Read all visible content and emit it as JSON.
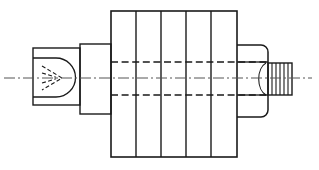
{
  "document": {
    "title": "Mechanical Part Orthographic Section View",
    "background_color": "#ffffff",
    "line_color": "#1a1a1a",
    "centerline_color": "#555555",
    "hidden_line_color": "#1a1a1a",
    "canvas": {
      "width": 319,
      "height": 170
    }
  },
  "drawing": {
    "type": "engineering-orthographic-section",
    "description": "Cylindrical finned machine component shown in side elevation with hidden-detail dashed lines and an axial dash-dot centerline",
    "axis": {
      "name": "centerline",
      "style": "dash-dot",
      "y": 78,
      "x_start": 4,
      "x_end": 312,
      "color": "#555555",
      "width": 1
    },
    "features": [
      {
        "name": "left-end-block",
        "shape": "rectangle",
        "x": 33,
        "y": 48,
        "width": 47,
        "height": 57,
        "label": "Left End Block"
      },
      {
        "name": "internal-cavity",
        "shape": "u-slot-rounded-right",
        "x": 39,
        "y": 58,
        "width": 36,
        "height": 39,
        "corner_radius": 19,
        "label": "Internal Bore Cavity"
      },
      {
        "name": "conical-point-detail",
        "shape": "chevron-dashed",
        "apex_x": 62,
        "apex_y": 78,
        "back_x": 42,
        "top_y": 66,
        "bottom_y": 90,
        "style": "dashed",
        "label": "Conical Point Hidden Detail"
      },
      {
        "name": "left-collar",
        "shape": "rectangle",
        "x": 80,
        "y": 44,
        "width": 31,
        "height": 70,
        "label": "Left Shoulder Collar"
      },
      {
        "name": "finned-body",
        "shape": "rectangle",
        "x": 111,
        "y": 11,
        "width": 126,
        "height": 146,
        "label": "Finned Main Body",
        "fin_count": 5,
        "divider_x_positions": [
          136,
          161,
          186,
          211
        ]
      },
      {
        "name": "hidden-bore-upper",
        "shape": "horizontal-dashed-line",
        "y": 62,
        "x_start": 111,
        "x_end": 239,
        "label": "Upper Hidden Bore Line"
      },
      {
        "name": "hidden-bore-lower",
        "shape": "horizontal-dashed-line",
        "y": 95,
        "x_start": 111,
        "x_end": 239,
        "label": "Lower Hidden Bore Line"
      },
      {
        "name": "right-hex-collar",
        "shape": "rectangle-rounded-right",
        "x": 237,
        "y": 45,
        "width": 31,
        "height": 72,
        "corner_radius": 7,
        "label": "Right Hex Nut Collar"
      },
      {
        "name": "threaded-shaft",
        "shape": "rectangle-hatched",
        "x": 268,
        "y": 63,
        "width": 24,
        "height": 32,
        "thread_line_count": 6,
        "thread_x_positions": [
          272,
          276,
          280,
          284,
          288
        ],
        "label": "Threaded Shaft End"
      }
    ],
    "counts": {
      "fin_segments": 5,
      "fin_dividers": 4,
      "thread_lines": 5,
      "hidden_lines": 2,
      "centerlines": 1
    }
  }
}
